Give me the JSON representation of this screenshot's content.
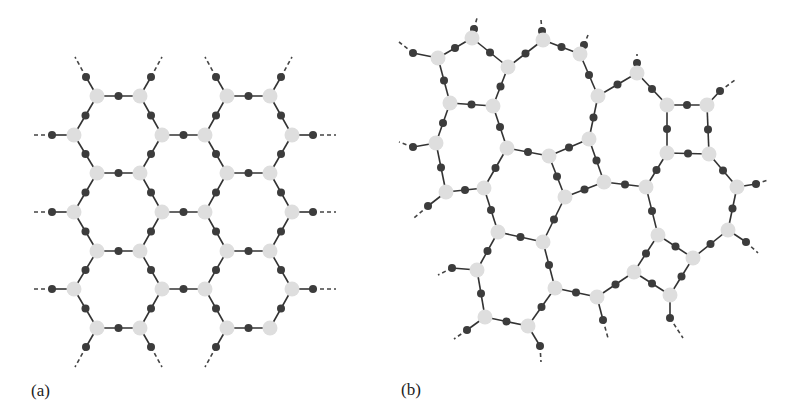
{
  "figure": {
    "panels": [
      {
        "id": "a",
        "label": "(a)",
        "description": "Regular hexagonal lattice (ordered network)"
      },
      {
        "id": "b",
        "label": "(b)",
        "description": "Disordered continuous random network with irregular rings"
      }
    ],
    "colors": {
      "background": "#ffffff",
      "light_node": "#dedede",
      "dark_node": "#3c3c3c",
      "bond": "#333333",
      "tail": "#444444"
    },
    "sizes": {
      "light_r": 7.5,
      "dark_r": 4,
      "bond_w": 1.6
    }
  },
  "panel_a": {
    "light_nodes": [
      [
        97,
        96
      ],
      [
        140,
        96
      ],
      [
        227,
        96
      ],
      [
        270,
        96
      ],
      [
        74,
        135
      ],
      [
        162,
        135
      ],
      [
        205,
        135
      ],
      [
        292,
        135
      ],
      [
        97,
        173
      ],
      [
        140,
        173
      ],
      [
        227,
        173
      ],
      [
        270,
        173
      ],
      [
        74,
        212
      ],
      [
        162,
        212
      ],
      [
        205,
        212
      ],
      [
        292,
        212
      ],
      [
        97,
        251
      ],
      [
        140,
        251
      ],
      [
        227,
        251
      ],
      [
        270,
        251
      ],
      [
        74,
        289
      ],
      [
        162,
        289
      ],
      [
        205,
        289
      ],
      [
        292,
        289
      ],
      [
        97,
        328
      ],
      [
        140,
        328
      ],
      [
        227,
        328
      ],
      [
        270,
        328
      ]
    ],
    "bonds": [
      [
        [
          97,
          96
        ],
        [
          140,
          96
        ]
      ],
      [
        [
          227,
          96
        ],
        [
          270,
          96
        ]
      ],
      [
        [
          162,
          135
        ],
        [
          205,
          135
        ]
      ],
      [
        [
          97,
          173
        ],
        [
          140,
          173
        ]
      ],
      [
        [
          227,
          173
        ],
        [
          270,
          173
        ]
      ],
      [
        [
          162,
          212
        ],
        [
          205,
          212
        ]
      ],
      [
        [
          97,
          251
        ],
        [
          140,
          251
        ]
      ],
      [
        [
          227,
          251
        ],
        [
          270,
          251
        ]
      ],
      [
        [
          162,
          289
        ],
        [
          205,
          289
        ]
      ],
      [
        [
          97,
          328
        ],
        [
          140,
          328
        ]
      ],
      [
        [
          227,
          328
        ],
        [
          270,
          328
        ]
      ],
      [
        [
          97,
          96
        ],
        [
          74,
          135
        ]
      ],
      [
        [
          140,
          96
        ],
        [
          162,
          135
        ]
      ],
      [
        [
          227,
          96
        ],
        [
          205,
          135
        ]
      ],
      [
        [
          270,
          96
        ],
        [
          292,
          135
        ]
      ],
      [
        [
          74,
          135
        ],
        [
          97,
          173
        ]
      ],
      [
        [
          162,
          135
        ],
        [
          140,
          173
        ]
      ],
      [
        [
          205,
          135
        ],
        [
          227,
          173
        ]
      ],
      [
        [
          292,
          135
        ],
        [
          270,
          173
        ]
      ],
      [
        [
          97,
          173
        ],
        [
          74,
          212
        ]
      ],
      [
        [
          140,
          173
        ],
        [
          162,
          212
        ]
      ],
      [
        [
          227,
          173
        ],
        [
          205,
          212
        ]
      ],
      [
        [
          270,
          173
        ],
        [
          292,
          212
        ]
      ],
      [
        [
          74,
          212
        ],
        [
          97,
          251
        ]
      ],
      [
        [
          162,
          212
        ],
        [
          140,
          251
        ]
      ],
      [
        [
          205,
          212
        ],
        [
          227,
          251
        ]
      ],
      [
        [
          292,
          212
        ],
        [
          270,
          251
        ]
      ],
      [
        [
          97,
          251
        ],
        [
          74,
          289
        ]
      ],
      [
        [
          140,
          251
        ],
        [
          162,
          289
        ]
      ],
      [
        [
          227,
          251
        ],
        [
          205,
          289
        ]
      ],
      [
        [
          270,
          251
        ],
        [
          292,
          289
        ]
      ],
      [
        [
          74,
          289
        ],
        [
          97,
          328
        ]
      ],
      [
        [
          162,
          289
        ],
        [
          140,
          328
        ]
      ],
      [
        [
          205,
          289
        ],
        [
          227,
          328
        ]
      ],
      [
        [
          292,
          289
        ],
        [
          270,
          328
        ]
      ]
    ],
    "tails": [
      {
        "from": [
          74,
          135
        ],
        "dark": [
          52,
          135
        ],
        "to": [
          31,
          135
        ]
      },
      {
        "from": [
          74,
          212
        ],
        "dark": [
          52,
          212
        ],
        "to": [
          31,
          212
        ]
      },
      {
        "from": [
          74,
          289
        ],
        "dark": [
          52,
          289
        ],
        "to": [
          31,
          289
        ]
      },
      {
        "from": [
          292,
          135
        ],
        "dark": [
          313,
          135
        ],
        "to": [
          336,
          135
        ]
      },
      {
        "from": [
          292,
          212
        ],
        "dark": [
          313,
          212
        ],
        "to": [
          336,
          212
        ]
      },
      {
        "from": [
          292,
          289
        ],
        "dark": [
          313,
          289
        ],
        "to": [
          336,
          289
        ]
      },
      {
        "from": [
          97,
          96
        ],
        "dark": [
          86,
          77
        ],
        "to": [
          75,
          57
        ]
      },
      {
        "from": [
          140,
          96
        ],
        "dark": [
          151,
          77
        ],
        "to": [
          162,
          57
        ]
      },
      {
        "from": [
          227,
          96
        ],
        "dark": [
          216,
          77
        ],
        "to": [
          205,
          57
        ]
      },
      {
        "from": [
          270,
          96
        ],
        "dark": [
          281,
          77
        ],
        "to": [
          292,
          57
        ]
      },
      {
        "from": [
          97,
          328
        ],
        "dark": [
          86,
          347
        ],
        "to": [
          75,
          367
        ]
      },
      {
        "from": [
          140,
          328
        ],
        "dark": [
          151,
          347
        ],
        "to": [
          162,
          367
        ]
      },
      {
        "from": [
          227,
          328
        ],
        "dark": [
          216,
          347
        ],
        "to": [
          205,
          367
        ]
      }
    ]
  },
  "panel_b": {
    "light_nodes": {
      "L1": [
        438,
        58
      ],
      "L2": [
        472,
        38
      ],
      "L3": [
        508,
        67
      ],
      "L4": [
        543,
        40
      ],
      "L5": [
        580,
        54
      ],
      "L6": [
        450,
        103
      ],
      "L7": [
        493,
        106
      ],
      "L8": [
        436,
        143
      ],
      "L9": [
        507,
        148
      ],
      "L10": [
        549,
        156
      ],
      "L11": [
        589,
        139
      ],
      "L12": [
        598,
        96
      ],
      "L13": [
        637,
        73
      ],
      "L14": [
        667,
        105
      ],
      "L15": [
        707,
        105
      ],
      "L16": [
        667,
        153
      ],
      "L17": [
        709,
        154
      ],
      "L18": [
        446,
        192
      ],
      "L19": [
        484,
        188
      ],
      "L20": [
        565,
        197
      ],
      "L21": [
        498,
        232
      ],
      "L22": [
        543,
        242
      ],
      "L23": [
        477,
        270
      ],
      "L24": [
        555,
        288
      ],
      "L25": [
        604,
        182
      ],
      "L26": [
        646,
        187
      ],
      "L27": [
        737,
        187
      ],
      "L28": [
        728,
        230
      ],
      "L29": [
        658,
        235
      ],
      "L30": [
        693,
        258
      ],
      "L31": [
        634,
        272
      ],
      "L32": [
        597,
        297
      ],
      "L33": [
        485,
        317
      ],
      "L34": [
        528,
        326
      ],
      "L35": [
        670,
        295
      ]
    },
    "bonds": [
      [
        "L1",
        "L2"
      ],
      [
        "L2",
        "L3"
      ],
      [
        "L3",
        "L4"
      ],
      [
        "L4",
        "L5"
      ],
      [
        "L1",
        "L6"
      ],
      [
        "L6",
        "L7"
      ],
      [
        "L3",
        "L7"
      ],
      [
        "L6",
        "L8"
      ],
      [
        "L7",
        "L9"
      ],
      [
        "L9",
        "L10"
      ],
      [
        "L10",
        "L11"
      ],
      [
        "L5",
        "L12"
      ],
      [
        "L12",
        "L13"
      ],
      [
        "L13",
        "L14"
      ],
      [
        "L14",
        "L15"
      ],
      [
        "L14",
        "L16"
      ],
      [
        "L15",
        "L17"
      ],
      [
        "L12",
        "L11"
      ],
      [
        "L16",
        "L17"
      ],
      [
        "L11",
        "L25"
      ],
      [
        "L16",
        "L26"
      ],
      [
        "L17",
        "L27"
      ],
      [
        "L25",
        "L26"
      ],
      [
        "L25",
        "L20"
      ],
      [
        "L8",
        "L18"
      ],
      [
        "L18",
        "L19"
      ],
      [
        "L9",
        "L19"
      ],
      [
        "L10",
        "L20"
      ],
      [
        "L19",
        "L21"
      ],
      [
        "L21",
        "L22"
      ],
      [
        "L20",
        "L22"
      ],
      [
        "L21",
        "L23"
      ],
      [
        "L22",
        "L24"
      ],
      [
        "L27",
        "L28"
      ],
      [
        "L26",
        "L29"
      ],
      [
        "L29",
        "L30"
      ],
      [
        "L28",
        "L30"
      ],
      [
        "L29",
        "L31"
      ],
      [
        "L31",
        "L32"
      ],
      [
        "L31",
        "L35"
      ],
      [
        "L30",
        "L35"
      ],
      [
        "L23",
        "L33"
      ],
      [
        "L33",
        "L34"
      ],
      [
        "L34",
        "L24"
      ],
      [
        "L24",
        "L32"
      ]
    ],
    "tails": [
      {
        "from": "L1",
        "dark": [
          413,
          53
        ],
        "to": [
          399,
          42
        ]
      },
      {
        "from": "L2",
        "dark": [
          474,
          29
        ],
        "to": [
          477,
          18
        ]
      },
      {
        "from": "L4",
        "dark": [
          542,
          31
        ],
        "to": [
          541,
          20
        ]
      },
      {
        "from": "L5",
        "dark": [
          584,
          45
        ],
        "to": [
          588,
          35
        ]
      },
      {
        "from": "L13",
        "dark": [
          637,
          63
        ],
        "to": [
          637,
          54
        ]
      },
      {
        "from": "L15",
        "dark": [
          720,
          91
        ],
        "to": [
          735,
          80
        ]
      },
      {
        "from": "L8",
        "dark": [
          413,
          147
        ],
        "to": [
          399,
          142
        ]
      },
      {
        "from": "L18",
        "dark": [
          428,
          206
        ],
        "to": [
          414,
          218
        ]
      },
      {
        "from": "L27",
        "dark": [
          756,
          184
        ],
        "to": [
          768,
          180
        ]
      },
      {
        "from": "L28",
        "dark": [
          746,
          242
        ],
        "to": [
          758,
          253
        ]
      },
      {
        "from": "L23",
        "dark": [
          452,
          268
        ],
        "to": [
          438,
          275
        ]
      },
      {
        "from": "L33",
        "dark": [
          467,
          330
        ],
        "to": [
          454,
          339
        ]
      },
      {
        "from": "L34",
        "dark": [
          540,
          346
        ],
        "to": [
          541,
          362
        ]
      },
      {
        "from": "L32",
        "dark": [
          603,
          320
        ],
        "to": [
          608,
          338
        ]
      },
      {
        "from": "L35",
        "dark": [
          670,
          318
        ],
        "to": [
          683,
          338
        ]
      }
    ]
  }
}
